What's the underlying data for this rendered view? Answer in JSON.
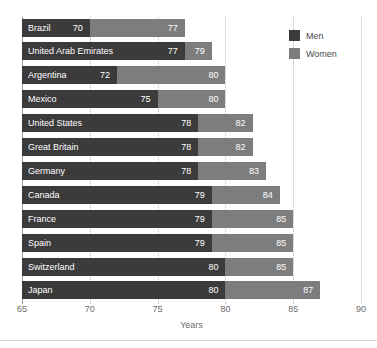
{
  "chart_data": {
    "type": "bar",
    "orientation": "horizontal",
    "title": "",
    "xlabel": "Years",
    "ylabel": "",
    "xlim": [
      65,
      90
    ],
    "xticks": [
      65,
      70,
      75,
      80,
      85,
      90
    ],
    "xtick_labels": [
      "65",
      "70",
      "75",
      "80",
      "85",
      "90"
    ],
    "grid": true,
    "grid_axis": "x",
    "grid_style": "dotted",
    "legend_position": "top-right",
    "legend": [
      "Men",
      "Women"
    ],
    "categories": [
      "Brazil",
      "United Arab Emirates",
      "Argentina",
      "Mexico",
      "United States",
      "Great Britain",
      "Germany",
      "Canada",
      "France",
      "Spain",
      "Switzerland",
      "Japan"
    ],
    "series": [
      {
        "name": "Men",
        "color": "#3b3b3b",
        "values": [
          70,
          77,
          72,
          75,
          78,
          78,
          78,
          79,
          79,
          79,
          80,
          80
        ]
      },
      {
        "name": "Women",
        "color": "#7d7d7d",
        "values": [
          77,
          79,
          80,
          80,
          82,
          82,
          83,
          84,
          85,
          85,
          85,
          87
        ]
      }
    ],
    "rows": [
      {
        "country": "Brazil",
        "men": 70,
        "women": 77
      },
      {
        "country": "United Arab Emirates",
        "men": 77,
        "women": 79
      },
      {
        "country": "Argentina",
        "men": 72,
        "women": 80
      },
      {
        "country": "Mexico",
        "men": 75,
        "women": 80
      },
      {
        "country": "United States",
        "men": 78,
        "women": 82
      },
      {
        "country": "Great Britain",
        "men": 78,
        "women": 82
      },
      {
        "country": "Germany",
        "men": 78,
        "women": 83
      },
      {
        "country": "Canada",
        "men": 79,
        "women": 84
      },
      {
        "country": "France",
        "men": 79,
        "women": 85
      },
      {
        "country": "Spain",
        "men": 79,
        "women": 85
      },
      {
        "country": "Switzerland",
        "men": 80,
        "women": 85
      },
      {
        "country": "Japan",
        "men": 80,
        "women": 87
      }
    ]
  },
  "legend": {
    "items": [
      {
        "label": "Men",
        "color": "#3b3b3b"
      },
      {
        "label": "Women",
        "color": "#7d7d7d"
      }
    ]
  },
  "axis": {
    "title": "Years",
    "ticks": [
      "65",
      "70",
      "75",
      "80",
      "85",
      "90"
    ]
  },
  "colors": {
    "men": "#3b3b3b",
    "women": "#7d7d7d",
    "grid": "#b9b9b9",
    "axis_text": "#6b6b6b",
    "bar_text": "#ffffff",
    "background": "#ffffff"
  }
}
